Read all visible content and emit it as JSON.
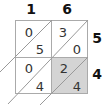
{
  "diagram": {
    "type": "lattice-multiplication",
    "top_digits": [
      "1",
      "6"
    ],
    "right_digits": [
      "5",
      "4"
    ],
    "cells": [
      [
        {
          "tens": "0",
          "ones": "5"
        },
        {
          "tens": "3",
          "ones": "0"
        }
      ],
      [
        {
          "tens": "0",
          "ones": "4"
        },
        {
          "tens": "2",
          "ones": "4"
        }
      ]
    ],
    "highlighted_cell": "row 2, column 2",
    "colors": {
      "grid_line": "#aaaaaa",
      "highlight_fill": "#d4d4d4",
      "background": "#ffffff",
      "text": "#333333"
    }
  }
}
